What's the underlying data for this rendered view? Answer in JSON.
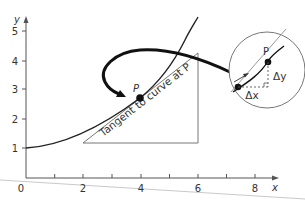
{
  "diagram": {
    "title": "Tangent to curve at P",
    "axes": {
      "x_label": "x",
      "y_label": "y",
      "x_ticks": [
        "0",
        "2",
        "4",
        "6",
        "8"
      ],
      "y_ticks": [
        "1",
        "2",
        "3",
        "4",
        "5"
      ]
    },
    "point_label": "P",
    "tangent_label": "Tangent to curve at P",
    "inset": {
      "point_label": "P",
      "delta_x": "Δx",
      "delta_y": "Δy"
    }
  }
}
